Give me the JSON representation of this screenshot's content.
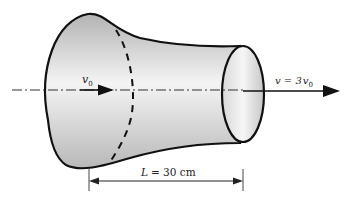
{
  "diagram": {
    "type": "physics-figure",
    "labels": {
      "inlet_velocity": "v",
      "inlet_velocity_sub": "0",
      "outlet_velocity_prefix": "v = 3",
      "outlet_velocity_var": "v",
      "outlet_velocity_sub": "0",
      "length_var": "L",
      "length_value": "= 30 cm"
    },
    "colors": {
      "outline": "#111111",
      "fill_light": "#f2f2f2",
      "fill_dark": "#b8b8b8",
      "axis": "#222222"
    }
  }
}
